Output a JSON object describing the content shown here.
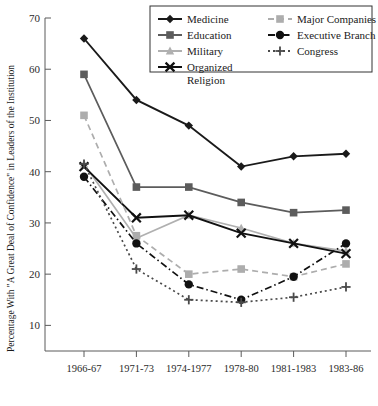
{
  "chart_data": {
    "type": "line",
    "title": "",
    "xlabel": "",
    "ylabel": "Percentage With \"A Great Deal of Confidence\" in Leaders of the Institution",
    "categories": [
      "1966-67",
      "1971-73",
      "1974-1977",
      "1978-80",
      "1981-1983",
      "1983-86"
    ],
    "ylim": [
      5,
      70
    ],
    "yticks": [
      10,
      20,
      30,
      40,
      50,
      60,
      70
    ],
    "grid": false,
    "legend_position": "top-right",
    "series": [
      {
        "name": "Medicine",
        "values": [
          66,
          54,
          49,
          41,
          43,
          43.5
        ],
        "color": "#1a1a1a",
        "marker": "diamond",
        "dash": "solid"
      },
      {
        "name": "Education",
        "values": [
          59,
          37,
          37,
          34,
          32,
          32.5
        ],
        "color": "#5c5c5c",
        "marker": "square",
        "dash": "solid"
      },
      {
        "name": "Military",
        "values": [
          41.5,
          27,
          31.5,
          29,
          26,
          24.5
        ],
        "color": "#b0b0b0",
        "marker": "triangle",
        "dash": "solid"
      },
      {
        "name": "Organized Religion",
        "values": [
          41,
          31,
          31.5,
          28,
          26,
          24
        ],
        "color": "#111111",
        "marker": "x",
        "dash": "solid"
      },
      {
        "name": "Major Companies",
        "values": [
          51,
          27.5,
          20,
          21,
          19.5,
          22
        ],
        "color": "#adadad",
        "marker": "square",
        "dash": "dashed"
      },
      {
        "name": "Executive Branch",
        "values": [
          39,
          26,
          18,
          15,
          19.5,
          26
        ],
        "color": "#111111",
        "marker": "circle",
        "dash": "dashdot"
      },
      {
        "name": "Congress",
        "values": [
          41.5,
          21,
          15,
          14.5,
          15.5,
          17.5
        ],
        "color": "#4a4a4a",
        "marker": "plus",
        "dash": "dotted"
      }
    ]
  },
  "legend": {
    "items": [
      {
        "label": "Medicine"
      },
      {
        "label": "Education"
      },
      {
        "label": "Military"
      },
      {
        "label": "Organized"
      },
      {
        "label": "Religion"
      },
      {
        "label": "Major Companies"
      },
      {
        "label": "Executive Branch"
      },
      {
        "label": "Congress"
      }
    ]
  },
  "axes": {
    "y_title": "Percentage With \"A Great Deal of Confidence\" in Leaders of the Institution",
    "y_ticks": [
      "70",
      "60",
      "50",
      "40",
      "30",
      "20",
      "10"
    ],
    "x_ticks": [
      "1966-67",
      "1971-73",
      "1974-1977",
      "1978-80",
      "1981-1983",
      "1983-86"
    ]
  }
}
